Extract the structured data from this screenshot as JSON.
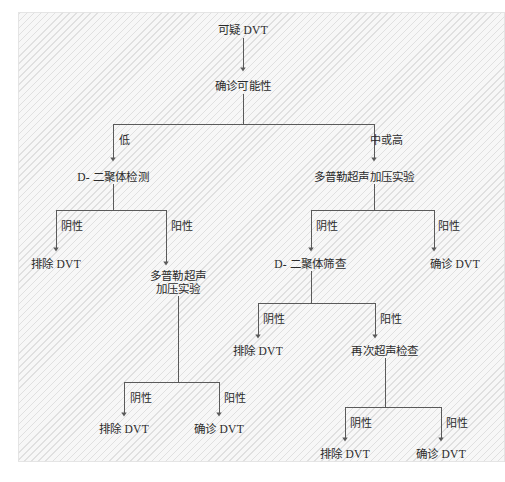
{
  "figure": {
    "kind": "flowchart",
    "caption": "",
    "panel": {
      "background_color": "#f7f7f7",
      "hatch_color": "#cdcdcd",
      "border_color": "#e2e2e2"
    },
    "line_color": "#5a5a5a",
    "text_color": "#2b2b2b"
  },
  "nodes": [
    {
      "id": "n1",
      "label": "可疑 DVT",
      "x": 243,
      "y": 31,
      "lines": [
        "可疑 DVT"
      ]
    },
    {
      "id": "n2",
      "label": "确诊可能性",
      "x": 243,
      "y": 87,
      "lines": [
        "确诊可能性"
      ]
    },
    {
      "id": "n3",
      "label": "D- 二聚体检测",
      "x": 113,
      "y": 178,
      "lines": [
        "D- 二聚体检测"
      ]
    },
    {
      "id": "n4",
      "label": "多普勒超声加压实验",
      "x": 364,
      "y": 178,
      "lines": [
        "多普勒超声加压实验"
      ]
    },
    {
      "id": "n5",
      "label": "排除 DVT",
      "x": 56,
      "y": 265,
      "lines": [
        "排除 DVT"
      ]
    },
    {
      "id": "n6",
      "label": "多普勒超声 加压实验",
      "x": 178,
      "y": 284,
      "lines": [
        "多普勒超声",
        "加压实验"
      ]
    },
    {
      "id": "n7",
      "label": "D- 二聚体筛查",
      "x": 310,
      "y": 265,
      "lines": [
        "D- 二聚体筛查"
      ]
    },
    {
      "id": "n8",
      "label": "确诊 DVT",
      "x": 455,
      "y": 265,
      "lines": [
        "确诊 DVT"
      ]
    },
    {
      "id": "n9",
      "label": "排除 DVT",
      "x": 258,
      "y": 352,
      "lines": [
        "排除 DVT"
      ]
    },
    {
      "id": "n10",
      "label": "再次超声检查",
      "x": 385,
      "y": 352,
      "lines": [
        "再次超声检查"
      ]
    },
    {
      "id": "n11",
      "label": "排除 DVT",
      "x": 124,
      "y": 430,
      "lines": [
        "排除 DVT"
      ]
    },
    {
      "id": "n12",
      "label": "确诊 DVT",
      "x": 219,
      "y": 430,
      "lines": [
        "确诊 DVT"
      ]
    },
    {
      "id": "n13",
      "label": "排除 DVT",
      "x": 345,
      "y": 455,
      "lines": [
        "排除 DVT"
      ]
    },
    {
      "id": "n14",
      "label": "确诊 DVT",
      "x": 441,
      "y": 455,
      "lines": [
        "确诊 DVT"
      ]
    }
  ],
  "edge_labels": [
    {
      "id": "e1",
      "text": "低",
      "x": 119,
      "y": 134
    },
    {
      "id": "e2",
      "text": "中或高",
      "x": 370,
      "y": 134
    },
    {
      "id": "e3",
      "text": "阴性",
      "x": 61,
      "y": 220
    },
    {
      "id": "e4",
      "text": "阳性",
      "x": 171,
      "y": 220
    },
    {
      "id": "e5",
      "text": "阴性",
      "x": 316,
      "y": 220
    },
    {
      "id": "e6",
      "text": "阳性",
      "x": 438,
      "y": 220
    },
    {
      "id": "e7",
      "text": "阴性",
      "x": 263,
      "y": 313
    },
    {
      "id": "e8",
      "text": "阳性",
      "x": 380,
      "y": 313
    },
    {
      "id": "e9",
      "text": "阴性",
      "x": 130,
      "y": 392
    },
    {
      "id": "e10",
      "text": "阳性",
      "x": 224,
      "y": 392
    },
    {
      "id": "e11",
      "text": "阴性",
      "x": 350,
      "y": 417
    },
    {
      "id": "e12",
      "text": "阳性",
      "x": 446,
      "y": 417
    }
  ],
  "edges": [
    {
      "from": "n1",
      "to": "n2",
      "kind": "vertical",
      "label": ""
    },
    {
      "from": "n2",
      "to": "n3",
      "kind": "elbow",
      "label": "低"
    },
    {
      "from": "n2",
      "to": "n4",
      "kind": "elbow",
      "label": "中或高"
    },
    {
      "from": "n3",
      "to": "n5",
      "kind": "elbow",
      "label": "阴性"
    },
    {
      "from": "n3",
      "to": "n6",
      "kind": "elbow",
      "label": "阳性"
    },
    {
      "from": "n4",
      "to": "n7",
      "kind": "elbow",
      "label": "阴性"
    },
    {
      "from": "n4",
      "to": "n8",
      "kind": "elbow",
      "label": "阳性"
    },
    {
      "from": "n7",
      "to": "n9",
      "kind": "elbow",
      "label": "阴性"
    },
    {
      "from": "n7",
      "to": "n10",
      "kind": "elbow",
      "label": "阳性"
    },
    {
      "from": "n6",
      "to": "n11",
      "kind": "elbow",
      "label": "阴性"
    },
    {
      "from": "n6",
      "to": "n12",
      "kind": "elbow",
      "label": "阳性"
    },
    {
      "from": "n10",
      "to": "n13",
      "kind": "elbow",
      "label": "阴性"
    },
    {
      "from": "n10",
      "to": "n14",
      "kind": "elbow",
      "label": "阳性"
    }
  ]
}
